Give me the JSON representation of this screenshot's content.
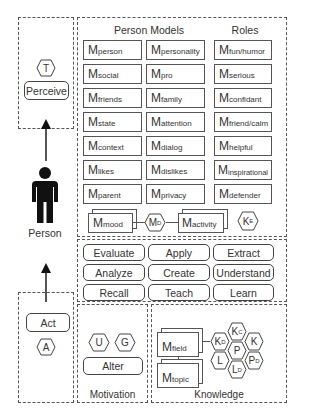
{
  "perceive_panel": {
    "hex_label": "T",
    "button_label": "Perceive"
  },
  "person": {
    "label": "Person",
    "icon": "person-icon"
  },
  "act_panel": {
    "button_label": "Act",
    "hex_label": "A"
  },
  "person_models": {
    "title": "Person Models",
    "col1": [
      {
        "base": "M",
        "sub": "person"
      },
      {
        "base": "M",
        "sub": "social"
      },
      {
        "base": "M",
        "sub": "friends"
      },
      {
        "base": "M",
        "sub": "state"
      },
      {
        "base": "M",
        "sub": "context"
      },
      {
        "base": "M",
        "sub": "likes"
      },
      {
        "base": "M",
        "sub": "parent"
      }
    ],
    "col2": [
      {
        "base": "M",
        "sub": "personality"
      },
      {
        "base": "M",
        "sub": "pro"
      },
      {
        "base": "M",
        "sub": "family"
      },
      {
        "base": "M",
        "sub": "attention"
      },
      {
        "base": "M",
        "sub": "dialog"
      },
      {
        "base": "M",
        "sub": "dislikes"
      },
      {
        "base": "M",
        "sub": "privacy"
      }
    ]
  },
  "roles": {
    "title": "Roles",
    "items": [
      {
        "base": "M",
        "sub": "fun/humor"
      },
      {
        "base": "M",
        "sub": "serious"
      },
      {
        "base": "M",
        "sub": "confidant"
      },
      {
        "base": "M",
        "sub": "friend/calm"
      },
      {
        "base": "M",
        "sub": "helpful"
      },
      {
        "base": "M",
        "sub": "inspirational"
      },
      {
        "base": "M",
        "sub": "defender"
      }
    ]
  },
  "mood_row": {
    "mood": {
      "base": "M",
      "sub": "mood"
    },
    "md_hex": {
      "base": "M",
      "sub": "D"
    },
    "activity": {
      "base": "M",
      "sub": "activity"
    },
    "ke_hex": {
      "base": "K",
      "sub": "E"
    }
  },
  "actions": {
    "rows": [
      [
        "Evaluate",
        "Apply",
        "Extract"
      ],
      [
        "Analyze",
        "Create",
        "Understand"
      ],
      [
        "Recall",
        "Teach",
        "Learn"
      ]
    ]
  },
  "motivation": {
    "title": "Motivation",
    "hexes": [
      "U",
      "G"
    ],
    "button_label": "Alter"
  },
  "knowledge": {
    "title": "Knowledge",
    "field": {
      "base": "M",
      "sub": "field"
    },
    "topic": {
      "base": "M",
      "sub": "topic"
    },
    "hexes": {
      "kd": {
        "base": "K",
        "sub": "D"
      },
      "kc": {
        "base": "K",
        "sub": "C"
      },
      "k": {
        "base": "K",
        "sub": ""
      },
      "p": {
        "base": "P",
        "sub": ""
      },
      "l": {
        "base": "L",
        "sub": ""
      },
      "pd": {
        "base": "P",
        "sub": "D"
      },
      "ld": {
        "base": "L",
        "sub": "D"
      }
    }
  }
}
